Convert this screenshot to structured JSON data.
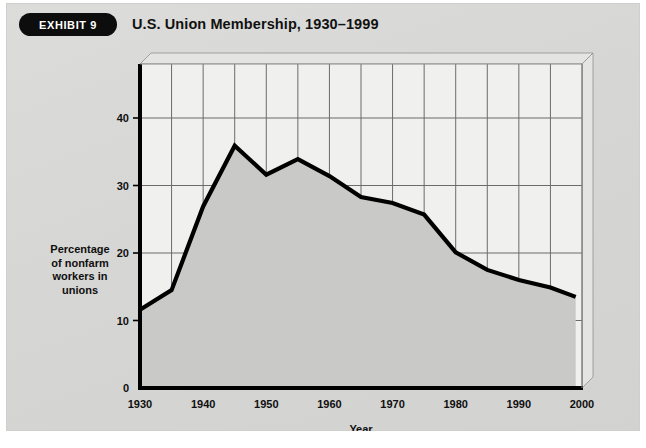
{
  "exhibit": {
    "badge_label": "EXHIBIT 9",
    "title": "U.S. Union Membership, 1930–1999"
  },
  "colors": {
    "card_background": "#d8d8d6",
    "badge_background": "#0d0d0d",
    "badge_text": "#ffffff",
    "plot_background": "#f0f0ee",
    "area_fill": "#c9c9c7",
    "line": "#000000",
    "gridline": "#6b6b6b",
    "axis": "#000000",
    "bevel_face": "#e4e4e2"
  },
  "chart_data": {
    "type": "line",
    "title": "U.S. Union Membership, 1930–1999",
    "xlabel": "Year",
    "ylabel": "Percentage of nonfarm workers in unions",
    "ylabel_lines": [
      "Percentage",
      "of nonfarm",
      "workers in",
      "unions"
    ],
    "xlim": [
      1930,
      2000
    ],
    "ylim": [
      0,
      48
    ],
    "xticks": [
      1930,
      1940,
      1950,
      1960,
      1970,
      1980,
      1990,
      2000
    ],
    "xtick_labels": [
      "1930",
      "1940",
      "1950",
      "1960",
      "1970",
      "1980",
      "1990",
      "2000"
    ],
    "yticks": [
      0,
      10,
      20,
      30,
      40
    ],
    "ytick_labels": [
      "0",
      "10",
      "20",
      "30",
      "40"
    ],
    "gridlines_x": [
      1935,
      1940,
      1945,
      1950,
      1955,
      1960,
      1965,
      1970,
      1975,
      1980,
      1985,
      1990,
      1995,
      2000
    ],
    "gridlines_y": [
      10,
      20,
      30,
      40
    ],
    "grid": true,
    "legend": null,
    "fill_under": true,
    "x": [
      1930,
      1935,
      1940,
      1945,
      1950,
      1955,
      1960,
      1965,
      1970,
      1975,
      1980,
      1985,
      1990,
      1995,
      1999
    ],
    "values": [
      11.6,
      14.5,
      26.9,
      35.9,
      31.6,
      33.9,
      31.4,
      28.3,
      27.4,
      25.7,
      20.1,
      17.5,
      16.0,
      14.9,
      13.5
    ],
    "series": [
      {
        "name": "Percentage of nonfarm workers in unions",
        "values": [
          11.6,
          14.5,
          26.9,
          35.9,
          31.6,
          33.9,
          31.4,
          28.3,
          27.4,
          25.7,
          20.1,
          17.5,
          16.0,
          14.9,
          13.5
        ]
      }
    ]
  }
}
